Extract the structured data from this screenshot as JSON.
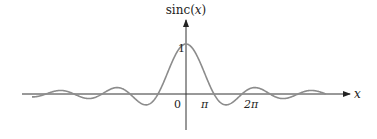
{
  "diagram": {
    "y_axis_label": "sinc(x)",
    "y_axis_label_parts": {
      "fn": "sinc",
      "open": "(",
      "var": "x",
      "close": ")"
    },
    "x_axis_label": "x",
    "y_tick_label": "1",
    "x_tick_labels": {
      "origin": "0",
      "pi": "π",
      "two_pi": "2π"
    },
    "curve_color": "#8c8c8c",
    "axis_color": "#333333",
    "function": "sin(x)/x",
    "x_range_in_pi": [
      -5.5,
      5.0
    ]
  },
  "chart_data": {
    "type": "line",
    "title": "sinc(x)",
    "xlabel": "x",
    "ylabel": "sinc(x)",
    "x_ticks": [
      "0",
      "π",
      "2π"
    ],
    "y_ticks": [
      "1"
    ],
    "series": [
      {
        "name": "sinc(x) = sin(x)/x",
        "x_pi": [
          -5,
          -4,
          -3,
          -2,
          -1,
          0,
          1,
          2,
          3,
          4,
          5
        ],
        "zeros_at": "nπ, n≠0",
        "peak": {
          "x": 0,
          "y": 1
        }
      }
    ],
    "ylim": [
      -0.25,
      1.0
    ],
    "grid": false
  }
}
